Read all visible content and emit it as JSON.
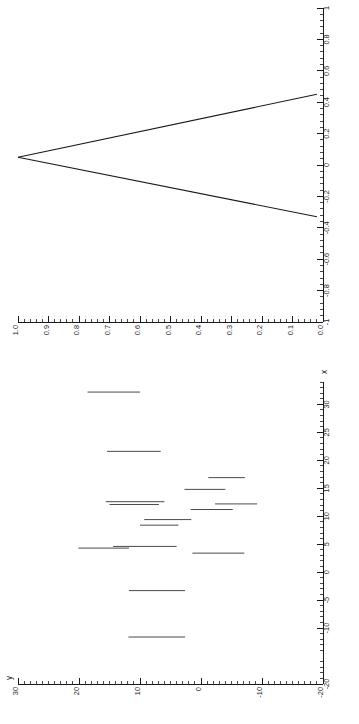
{
  "figure": {
    "title": "",
    "orientation": "rotated-90",
    "background_color": "#ffffff",
    "line_color": "#1a1a1a",
    "segment_color": "#4a4a4a"
  },
  "chart_data": [
    {
      "id": "top-wedge-plot",
      "type": "line",
      "title": "",
      "xlabel": "",
      "ylabel": "",
      "orientation": "rotated-90",
      "grid": false,
      "legend": null,
      "horizontal_axis": {
        "name": "horizontal-axis",
        "range_label": "1.0 to 0.0",
        "lim": [
          1.0,
          0.0
        ],
        "direction": "decreasing-left-to-right",
        "major_step": 0.1,
        "minor_per_major": 5,
        "tick_labels": [
          "1.0",
          "0.9",
          "0.8",
          "0.7",
          "0.6",
          "0.5",
          "0.4",
          "0.3",
          "0.2",
          "0.1",
          "0.0"
        ],
        "tick_values": [
          1.0,
          0.9,
          0.8,
          0.7,
          0.6,
          0.5,
          0.4,
          0.3,
          0.2,
          0.1,
          0.0
        ]
      },
      "vertical_axis": {
        "name": "vertical-axis",
        "range_label": "-1 to 1",
        "lim": [
          -1,
          1
        ],
        "direction": "increasing-bottom-to-top",
        "major_step": 0.2,
        "minor_per_major": 5,
        "tick_labels": [
          "-1",
          "-0.8",
          "-0.6",
          "-0.4",
          "-0.2",
          "0",
          "0.2",
          "0.4",
          "0.6",
          "0.8",
          "1"
        ],
        "tick_values": [
          -1,
          -0.8,
          -0.6,
          -0.4,
          -0.2,
          0,
          0.2,
          0.4,
          0.6,
          0.8,
          1
        ]
      },
      "series": [
        {
          "name": "upper-branch",
          "points": [
            [
              1.0,
              0.05
            ],
            [
              0.02,
              0.45
            ]
          ]
        },
        {
          "name": "lower-branch",
          "points": [
            [
              1.0,
              0.05
            ],
            [
              0.02,
              -0.33
            ]
          ]
        }
      ]
    },
    {
      "id": "bottom-segment-plot",
      "type": "scatter",
      "title": "",
      "xlabel": "x",
      "ylabel": "y",
      "orientation": "rotated-90",
      "grid": false,
      "legend": null,
      "horizontal_axis": {
        "name": "y-axis",
        "label": "y",
        "range_label": "30 to -20",
        "lim": [
          30,
          -20
        ],
        "direction": "decreasing-left-to-right",
        "major_step": 10,
        "minor_per_major": 10,
        "tick_labels": [
          "30",
          "20",
          "10",
          "0",
          "-10",
          "-20"
        ],
        "tick_values": [
          30,
          20,
          10,
          0,
          -10,
          -20
        ]
      },
      "vertical_axis": {
        "name": "x-axis",
        "label": "x",
        "range_label": "-20 to 34",
        "lim": [
          -20,
          34
        ],
        "direction": "increasing-bottom-to-top",
        "major_step": 5,
        "minor_per_major": 5,
        "tick_labels": [
          "-20",
          "-10",
          "-5",
          "0",
          "5",
          "10",
          "15",
          "20",
          "25",
          "30"
        ],
        "tick_values": [
          -20,
          -10,
          -5,
          0,
          5,
          10,
          15,
          20,
          25,
          30
        ]
      },
      "segments": [
        {
          "name": "segment-1",
          "x": 32.2,
          "y_start": 18.6,
          "y_end": 10.0
        },
        {
          "name": "segment-2",
          "x": 21.6,
          "y_start": 15.4,
          "y_end": 6.6
        },
        {
          "name": "segment-3",
          "x": 16.9,
          "y_start": -1.2,
          "y_end": -7.2
        },
        {
          "name": "segment-4",
          "x": 14.8,
          "y_start": 2.7,
          "y_end": -4.0
        },
        {
          "name": "segment-5",
          "x": 12.6,
          "y_start": 15.6,
          "y_end": 6.0
        },
        {
          "name": "segment-6",
          "x": 12.2,
          "y_start": -2.3,
          "y_end": -9.2
        },
        {
          "name": "segment-7",
          "x": 12.1,
          "y_start": 15.0,
          "y_end": 6.9
        },
        {
          "name": "segment-8",
          "x": 11.2,
          "y_start": 1.7,
          "y_end": -5.2
        },
        {
          "name": "segment-9",
          "x": 9.4,
          "y_start": 9.3,
          "y_end": 1.6
        },
        {
          "name": "segment-10",
          "x": 8.4,
          "y_start": 10.0,
          "y_end": 3.7
        },
        {
          "name": "segment-11",
          "x": 4.6,
          "y_start": 14.4,
          "y_end": 4.0
        },
        {
          "name": "segment-12",
          "x": 4.3,
          "y_start": 20.1,
          "y_end": 11.8
        },
        {
          "name": "segment-13",
          "x": 3.4,
          "y_start": 1.4,
          "y_end": -7.1
        },
        {
          "name": "segment-14",
          "x": -3.3,
          "y_start": 11.8,
          "y_end": 2.6
        },
        {
          "name": "segment-15",
          "x": -11.6,
          "y_start": 11.9,
          "y_end": 2.6
        }
      ]
    }
  ]
}
